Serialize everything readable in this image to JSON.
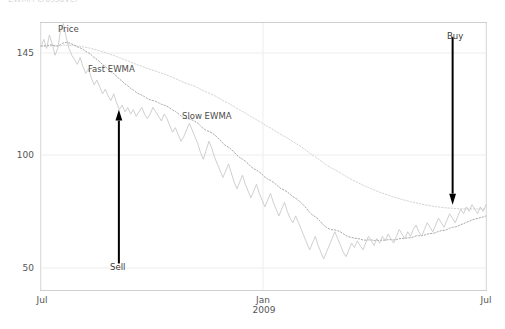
{
  "chart_title": "EWMA crossover",
  "chart_data": {
    "type": "line",
    "title": "EWMA crossover",
    "xlabel": "",
    "ylabel": "",
    "grid": true,
    "legend_position": "inline-annotations",
    "xlim": [
      "Jul 2008",
      "Jul 2009"
    ],
    "ylim": [
      44,
      160
    ],
    "y_ticks": [
      {
        "value": 145,
        "label": "145"
      },
      {
        "value": 100,
        "label": "100"
      },
      {
        "value": 50,
        "label": "50"
      }
    ],
    "x_ticks": [
      {
        "label": "Jul",
        "sublabel": ""
      },
      {
        "label": "Jan",
        "sublabel": "2009"
      },
      {
        "label": "Jul",
        "sublabel": ""
      }
    ],
    "series": [
      {
        "name": "Price",
        "label": "Price",
        "style": "solid",
        "color": "#c9c9c9",
        "values": [
          148,
          151,
          147,
          153,
          149,
          144,
          147,
          155,
          158,
          152,
          147,
          144,
          142,
          140,
          143,
          139,
          136,
          138,
          134,
          131,
          133,
          130,
          127,
          129,
          126,
          124,
          127,
          123,
          120,
          122,
          119,
          121,
          118,
          120,
          117,
          119,
          121,
          118,
          116,
          118,
          121,
          119,
          117,
          115,
          118,
          116,
          113,
          110,
          112,
          109,
          106,
          108,
          111,
          114,
          111,
          108,
          105,
          101,
          98,
          102,
          106,
          103,
          99,
          96,
          93,
          90,
          93,
          96,
          92,
          88,
          85,
          88,
          91,
          87,
          84,
          81,
          84,
          87,
          83,
          80,
          77,
          80,
          83,
          79,
          76,
          73,
          76,
          79,
          75,
          72,
          70,
          73,
          70,
          67,
          64,
          61,
          58,
          61,
          64,
          60,
          57,
          54,
          57,
          60,
          63,
          66,
          63,
          60,
          57,
          55,
          58,
          61,
          59,
          62,
          60,
          58,
          61,
          64,
          62,
          60,
          63,
          61,
          64,
          62,
          65,
          63,
          61,
          64,
          67,
          65,
          63,
          66,
          64,
          67,
          69,
          66,
          64,
          67,
          70,
          68,
          66,
          69,
          72,
          70,
          68,
          71,
          74,
          72,
          70,
          73,
          76,
          74,
          77,
          75,
          78,
          76,
          74,
          77,
          75,
          78
        ]
      },
      {
        "name": "Fast EWMA",
        "label": "Fast EWMA",
        "style": "dotted",
        "color": "#a8a8a8",
        "span": "fast"
      },
      {
        "name": "Slow EWMA",
        "label": "Slow EWMA",
        "style": "dotted",
        "color": "#d2d2d2",
        "span": "slow"
      }
    ],
    "annotations": [
      {
        "name": "sell-signal",
        "label": "Sell",
        "direction": "up",
        "x_frac": 0.175,
        "y_top": 120,
        "y_bottom": 52,
        "color": "#000000"
      },
      {
        "name": "buy-signal",
        "label": "Buy",
        "direction": "down",
        "x_frac": 0.925,
        "y_top": 152,
        "y_bottom": 78,
        "color": "#000000"
      }
    ]
  },
  "labels": {
    "price": "Price",
    "fast_ewma": "Fast EWMA",
    "slow_ewma": "Slow EWMA",
    "sell": "Sell",
    "buy": "Buy",
    "ytick_145": "145",
    "ytick_100": "100",
    "ytick_50": "50",
    "xtick_left": "Jul",
    "xtick_mid": "Jan",
    "xtick_mid_sub": "2009",
    "xtick_right": "Jul"
  },
  "colors": {
    "price_line": "#c9c9c9",
    "fast_ewma_line": "#a8a8a8",
    "slow_ewma_line": "#d2d2d2",
    "grid": "#ededed",
    "frame": "#cfcfcf",
    "annotation_arrow": "#000000",
    "tick_text": "#555555"
  }
}
